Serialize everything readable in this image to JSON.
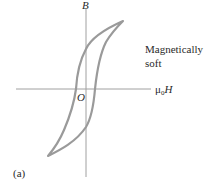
{
  "figure": {
    "panel_label": "(a)",
    "annotation_line1": "Magnetically",
    "annotation_line2": "soft",
    "axes": {
      "y_label": "B",
      "x_label_prefix": "μ",
      "x_label_subscript": "0",
      "x_label_symbol": "H",
      "origin_label": "O"
    },
    "curve": {
      "type": "hysteresis-loop",
      "description": "Narrow hysteresis loop of a magnetically soft material",
      "stroke_color": "#9a9a9a",
      "axis_color": "#9a9a9a"
    }
  }
}
